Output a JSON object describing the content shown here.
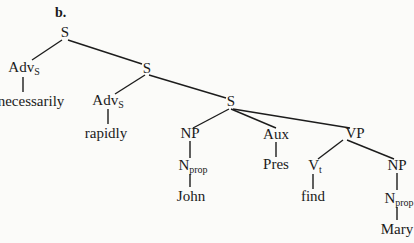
{
  "figure": {
    "label": "b."
  },
  "tree": {
    "nodes": {
      "s_root": {
        "label": "S",
        "sub": ""
      },
      "advs_1": {
        "label": "Adv",
        "sub": "S"
      },
      "necessarily": {
        "label": "necessarily",
        "sub": ""
      },
      "s_mid": {
        "label": "S",
        "sub": ""
      },
      "advs_2": {
        "label": "Adv",
        "sub": "S"
      },
      "rapidly": {
        "label": "rapidly",
        "sub": ""
      },
      "s_inner": {
        "label": "S",
        "sub": ""
      },
      "np_subj": {
        "label": "NP",
        "sub": ""
      },
      "nprop_subj": {
        "label": "N",
        "sub": "prop"
      },
      "john": {
        "label": "John",
        "sub": ""
      },
      "aux": {
        "label": "Aux",
        "sub": ""
      },
      "pres": {
        "label": "Pres",
        "sub": ""
      },
      "vp": {
        "label": "VP",
        "sub": ""
      },
      "vt": {
        "label": "V",
        "sub": "t"
      },
      "find": {
        "label": "find",
        "sub": ""
      },
      "np_obj": {
        "label": "NP",
        "sub": ""
      },
      "nprop_obj": {
        "label": "N",
        "sub": "prop"
      },
      "mary": {
        "label": "Mary",
        "sub": ""
      }
    },
    "edges": [
      [
        "s_root",
        "advs_1"
      ],
      [
        "s_root",
        "s_mid"
      ],
      [
        "advs_1",
        "necessarily"
      ],
      [
        "s_mid",
        "advs_2"
      ],
      [
        "s_mid",
        "s_inner"
      ],
      [
        "advs_2",
        "rapidly"
      ],
      [
        "s_inner",
        "np_subj"
      ],
      [
        "s_inner",
        "aux"
      ],
      [
        "s_inner",
        "vp"
      ],
      [
        "np_subj",
        "nprop_subj"
      ],
      [
        "nprop_subj",
        "john"
      ],
      [
        "aux",
        "pres"
      ],
      [
        "vp",
        "vt"
      ],
      [
        "vp",
        "np_obj"
      ],
      [
        "vt",
        "find"
      ],
      [
        "np_obj",
        "nprop_obj"
      ],
      [
        "nprop_obj",
        "mary"
      ]
    ],
    "sentence": "necessarily rapidly John Pres find Mary"
  }
}
